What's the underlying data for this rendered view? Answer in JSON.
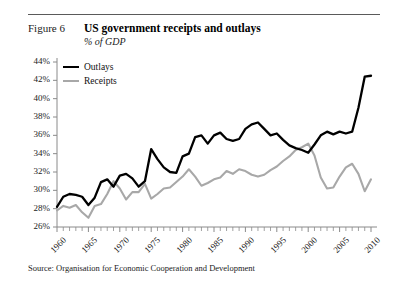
{
  "figure": {
    "label": "Figure 6",
    "title": "US government receipts and outlays",
    "subtitle": "% of GDP",
    "source": "Source: Organisation for Economic Cooperation and Development"
  },
  "legend": {
    "position": "top-left",
    "items": [
      {
        "label": "Outlays",
        "color": "#000000",
        "icon": "line-swatch-icon"
      },
      {
        "label": "Receipts",
        "color": "#a8a8a8",
        "icon": "line-swatch-icon"
      }
    ]
  },
  "axes": {
    "y_ticks": [
      "26%",
      "28%",
      "30%",
      "32%",
      "34%",
      "36%",
      "38%",
      "40%",
      "42%",
      "44%"
    ],
    "x_ticks": [
      "1960",
      "1965",
      "1970",
      "1975",
      "1980",
      "1985",
      "1990",
      "1995",
      "2000",
      "2005",
      "2010"
    ]
  },
  "chart_data": {
    "type": "line",
    "title": "US government receipts and outlays",
    "subtitle": "% of GDP",
    "xlabel": "",
    "ylabel": "% of GDP",
    "xlim": [
      1960,
      2010
    ],
    "ylim": [
      26,
      44
    ],
    "ytick_step": 2,
    "xtick_label_step": 5,
    "xtick_minor_step": 1,
    "grid": false,
    "legend_position": "top-left",
    "x": [
      1960,
      1961,
      1962,
      1963,
      1964,
      1965,
      1966,
      1967,
      1968,
      1969,
      1970,
      1971,
      1972,
      1973,
      1974,
      1975,
      1976,
      1977,
      1978,
      1979,
      1980,
      1981,
      1982,
      1983,
      1984,
      1985,
      1986,
      1987,
      1988,
      1989,
      1990,
      1991,
      1992,
      1993,
      1994,
      1995,
      1996,
      1997,
      1998,
      1999,
      2000,
      2001,
      2002,
      2003,
      2004,
      2005,
      2006,
      2007,
      2008,
      2009,
      2010
    ],
    "series": [
      {
        "name": "Outlays",
        "color": "#000000",
        "values": [
          28.2,
          29.3,
          29.6,
          29.5,
          29.3,
          28.4,
          29.2,
          30.9,
          31.2,
          30.4,
          31.6,
          31.8,
          31.3,
          30.4,
          31.0,
          34.5,
          33.4,
          32.5,
          32.0,
          31.9,
          33.7,
          34.0,
          35.8,
          36.0,
          35.1,
          36.0,
          36.3,
          35.6,
          35.4,
          35.6,
          36.7,
          37.2,
          37.4,
          36.7,
          36.0,
          36.2,
          35.5,
          34.9,
          34.6,
          34.4,
          34.1,
          35.0,
          36.0,
          36.4,
          36.1,
          36.4,
          36.2,
          36.4,
          39.0,
          42.4,
          42.5
        ]
      },
      {
        "name": "Receipts",
        "color": "#a8a8a8",
        "values": [
          27.8,
          28.3,
          28.1,
          28.4,
          27.6,
          27.0,
          28.3,
          28.5,
          29.6,
          31.0,
          30.2,
          29.0,
          29.8,
          29.8,
          30.7,
          29.1,
          29.6,
          30.2,
          30.3,
          30.9,
          31.5,
          32.3,
          31.5,
          30.5,
          30.8,
          31.2,
          31.4,
          32.1,
          31.8,
          32.3,
          32.1,
          31.7,
          31.5,
          31.7,
          32.2,
          32.6,
          33.2,
          33.7,
          34.4,
          34.7,
          35.1,
          33.8,
          31.4,
          30.2,
          30.3,
          31.5,
          32.5,
          32.9,
          31.8,
          29.9,
          31.2
        ]
      }
    ]
  }
}
